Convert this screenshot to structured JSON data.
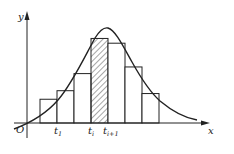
{
  "figure": {
    "axis_x_label": "x",
    "axis_y_label": "y",
    "origin_label": "O",
    "tick_labels": [
      {
        "base": "t",
        "sub": "1"
      },
      {
        "base": "t",
        "sub": "i"
      },
      {
        "base": "t",
        "sub": "i+1"
      }
    ],
    "bars": [
      {
        "relative_height": 0.25,
        "hatched": false
      },
      {
        "relative_height": 0.34,
        "hatched": false
      },
      {
        "relative_height": 0.52,
        "hatched": false
      },
      {
        "relative_height": 0.89,
        "hatched": true
      },
      {
        "relative_height": 0.84,
        "hatched": false
      },
      {
        "relative_height": 0.59,
        "hatched": false
      },
      {
        "relative_height": 0.31,
        "hatched": false
      }
    ],
    "hatched_bar_index": 3,
    "curve": "smooth unimodal density curve peaking near t_{i+1}",
    "colors": {
      "stroke": "#222222",
      "background": "#ffffff"
    }
  }
}
